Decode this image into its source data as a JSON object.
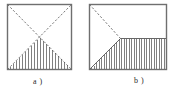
{
  "figure": {
    "type": "technical-line-diagram",
    "background_color": "#ffffff",
    "stroke_color": "#4a4a4a",
    "frame_color": "#6b6b6b",
    "panels": [
      {
        "id": "a",
        "caption": "a )",
        "frame": {
          "x": 7,
          "y": 4,
          "width": 65,
          "height": 66
        },
        "description": "square frame with two dashed diagonals crossing at centre and a vertically hatched triangle occupying the lower half",
        "elements": [
          {
            "name": "diagonal-top-left-to-bottom-right",
            "style": "dashed"
          },
          {
            "name": "diagonal-bottom-left-to-top-right",
            "style": "dashed"
          },
          {
            "name": "hatched-triangle",
            "style": "vertical-hatch",
            "hatch_count": 19
          }
        ]
      },
      {
        "id": "b",
        "caption": "b )",
        "frame": {
          "x": 89,
          "y": 4,
          "width": 78,
          "height": 66
        },
        "description": "rectangular frame with a dashed line descending from the top-left corner and a solid ramp rising from the bottom-left corner meeting at an apex, followed by a flat vertically hatched plateau extending to the right edge",
        "elements": [
          {
            "name": "dashed-descending-line",
            "style": "dashed"
          },
          {
            "name": "solid-ramp-line",
            "style": "solid"
          },
          {
            "name": "plateau-top-line",
            "style": "solid"
          },
          {
            "name": "hatched-region",
            "style": "vertical-hatch",
            "hatch_count": 30
          }
        ]
      }
    ]
  }
}
